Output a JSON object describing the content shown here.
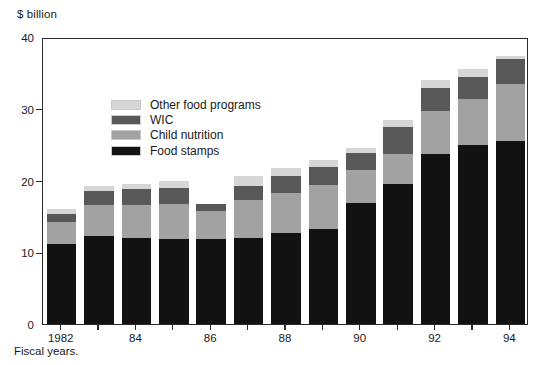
{
  "chart_data": {
    "type": "bar",
    "stacked": true,
    "title": "",
    "subtitle": "",
    "unit_label": "$ billion",
    "xlabel": "Fiscal years.",
    "ylabel": "",
    "ylim": [
      0,
      40
    ],
    "ytick_values": [
      0,
      10,
      20,
      30,
      40
    ],
    "ytick_labels": [
      "0",
      "10",
      "20",
      "30",
      "40"
    ],
    "grid": false,
    "legend_position": "upper-left-inside",
    "categories": [
      1982,
      1983,
      1984,
      1985,
      1986,
      1987,
      1988,
      1989,
      1990,
      1991,
      1992,
      1993,
      1994
    ],
    "xtick_labels": [
      "1982",
      "",
      "84",
      "",
      "86",
      "",
      "88",
      "",
      "90",
      "",
      "92",
      "",
      "94"
    ],
    "series": [
      {
        "name": "Food stamps",
        "color": "#121212",
        "values": [
          11.2,
          12.3,
          12.0,
          11.9,
          11.8,
          12.0,
          12.7,
          13.2,
          16.8,
          19.5,
          23.7,
          25.0,
          25.5
        ]
      },
      {
        "name": "Child nutrition",
        "color": "#a2a2a2",
        "values": [
          3.0,
          4.3,
          4.6,
          4.8,
          4.0,
          5.3,
          5.5,
          6.2,
          4.7,
          4.2,
          6.0,
          6.3,
          7.9
        ]
      },
      {
        "name": "WIC",
        "color": "#585858",
        "values": [
          1.2,
          2.0,
          2.2,
          2.3,
          0.9,
          2.0,
          2.5,
          2.5,
          2.4,
          3.8,
          3.2,
          3.1,
          3.5
        ]
      },
      {
        "name": "Other food programs",
        "color": "#d6d6d6",
        "values": [
          0.7,
          0.7,
          0.7,
          0.9,
          0.1,
          1.3,
          1.1,
          0.9,
          0.7,
          0.9,
          1.1,
          1.2,
          0.5
        ]
      }
    ],
    "totals": [
      16.1,
      19.3,
      19.5,
      19.9,
      16.8,
      20.6,
      21.8,
      22.8,
      24.6,
      28.4,
      34.0,
      35.6,
      37.4
    ],
    "legend": [
      {
        "label": "Other food programs",
        "color": "#d6d6d6"
      },
      {
        "label": "WIC",
        "color": "#585858"
      },
      {
        "label": "Child nutrition",
        "color": "#a2a2a2"
      },
      {
        "label": "Food stamps",
        "color": "#121212"
      }
    ]
  }
}
